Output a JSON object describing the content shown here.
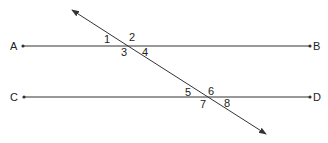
{
  "diagram": {
    "type": "parallel-lines-transversal",
    "colors": {
      "line": "#333333",
      "text": "#222222",
      "background": "#ffffff"
    },
    "lines": {
      "ab": {
        "start_label": "A",
        "end_label": "B"
      },
      "cd": {
        "start_label": "C",
        "end_label": "D"
      },
      "transversal": {
        "arrow_both_ends": true
      }
    },
    "angles": [
      "1",
      "2",
      "3",
      "4",
      "5",
      "6",
      "7",
      "8"
    ]
  }
}
